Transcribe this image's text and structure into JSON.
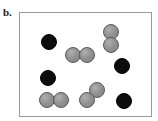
{
  "figure": {
    "panel_label": "b.",
    "background_color": "#ffffff"
  },
  "container": {
    "name": "reaction-vessel",
    "border_color": "#9a9a9a",
    "fill_color": "#ffffff",
    "left": 19,
    "top": 12,
    "width": 133,
    "height": 105
  },
  "legend_colors": {
    "black_particle": "#0d0d0d",
    "gray_particle": "#8e8e8e",
    "gray_particle_outline": "#5a5a5a"
  },
  "particles": [
    {
      "id": "black-1",
      "type": "black",
      "cx": 49,
      "cy": 42,
      "r": 8
    },
    {
      "id": "black-2",
      "type": "black",
      "cx": 48,
      "cy": 78,
      "r": 8
    },
    {
      "id": "black-3",
      "type": "black",
      "cx": 122,
      "cy": 66,
      "r": 8
    },
    {
      "id": "black-4",
      "type": "black",
      "cx": 124,
      "cy": 101,
      "r": 8
    },
    {
      "id": "gray-1",
      "type": "gray",
      "cx": 73,
      "cy": 55,
      "r": 8
    },
    {
      "id": "gray-2",
      "type": "gray",
      "cx": 87,
      "cy": 55,
      "r": 8
    },
    {
      "id": "gray-3",
      "type": "gray",
      "cx": 111,
      "cy": 32,
      "r": 8
    },
    {
      "id": "gray-4",
      "type": "gray",
      "cx": 111,
      "cy": 45,
      "r": 8
    },
    {
      "id": "gray-5",
      "type": "gray",
      "cx": 47,
      "cy": 100,
      "r": 8
    },
    {
      "id": "gray-6",
      "type": "gray",
      "cx": 61,
      "cy": 100,
      "r": 8
    },
    {
      "id": "gray-7",
      "type": "gray",
      "cx": 97,
      "cy": 90,
      "r": 8
    },
    {
      "id": "gray-8",
      "type": "gray",
      "cx": 87,
      "cy": 100,
      "r": 8
    }
  ],
  "counts": {
    "black_total": 4,
    "gray_total": 8
  }
}
